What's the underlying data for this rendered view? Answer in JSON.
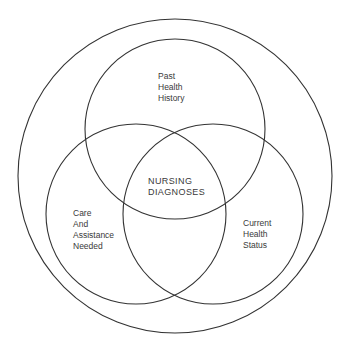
{
  "diagram": {
    "type": "venn",
    "stroke_color": "#333333",
    "background": "#ffffff",
    "outer_circle": {
      "cx": 175,
      "cy": 176,
      "r": 157
    },
    "circles": [
      {
        "id": "past-health-history",
        "cx": 175,
        "cy": 129,
        "r": 90,
        "label_lines": [
          "Past",
          "Health",
          "History"
        ]
      },
      {
        "id": "care-and-assistance-needed",
        "cx": 136,
        "cy": 214,
        "r": 90,
        "label_lines": [
          "Care",
          "And",
          "Assistance",
          "Needed"
        ]
      },
      {
        "id": "current-health-status",
        "cx": 213,
        "cy": 214,
        "r": 90,
        "label_lines": [
          "Current",
          "Health",
          "Status"
        ]
      }
    ],
    "center_label_lines": [
      "NURSING",
      "DIAGNOSES"
    ]
  }
}
